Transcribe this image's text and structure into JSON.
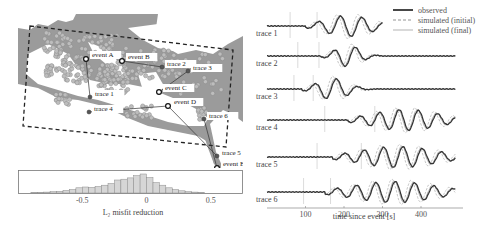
{
  "figure": {
    "map_panel": {
      "events": [
        {
          "label": "event A",
          "x": 68,
          "y": 45
        },
        {
          "label": "event B",
          "x": 104,
          "y": 47
        },
        {
          "label": "event C",
          "x": 141,
          "y": 78
        },
        {
          "label": "event D",
          "x": 150,
          "y": 92
        },
        {
          "label": "event E",
          "x": 199,
          "y": 154
        }
      ],
      "traces": [
        {
          "label": "trace 1",
          "x": 72,
          "y": 83,
          "from": "event A"
        },
        {
          "label": "trace 2",
          "x": 144,
          "y": 53,
          "from": "event B"
        },
        {
          "label": "trace 3",
          "x": 170,
          "y": 57,
          "from": "event C"
        },
        {
          "label": "trace 4",
          "x": 71,
          "y": 98,
          "from": "event D"
        },
        {
          "label": "trace 5",
          "x": 199,
          "y": 142,
          "from": "event D"
        },
        {
          "label": "trace 6",
          "x": 186,
          "y": 105,
          "from": "event E"
        }
      ],
      "colors": {
        "sea": "#9b9b9b",
        "land": "#ffffff",
        "station": "#bdbdbd",
        "station_edge": "#8a8a8a",
        "box": "#222222"
      }
    },
    "histogram": {
      "xlabel": "L₂ misfit reduction",
      "ticks": [
        "-0.5",
        "0",
        "0.5"
      ],
      "tick_values": [
        -0.5,
        0,
        0.5
      ],
      "xlim": [
        -1.0,
        0.75
      ]
    },
    "waveform_panel": {
      "legend": [
        {
          "label": "observed",
          "style": "solid-dark"
        },
        {
          "label": "simulated (initial)",
          "style": "dashed"
        },
        {
          "label": "simulated (final)",
          "style": "solid-light"
        }
      ],
      "trace_labels": [
        "trace 1",
        "trace 2",
        "trace 3",
        "trace 4",
        "trace 5",
        "trace 6"
      ],
      "xlabel": "time since event [s]",
      "xticks": [
        "100",
        "200",
        "300",
        "400"
      ]
    }
  },
  "chart_data": [
    {
      "type": "bar",
      "title": "",
      "xlabel": "L₂ misfit reduction",
      "ylabel": "",
      "xlim": [
        -1.0,
        0.75
      ],
      "bin_width": 0.05,
      "bin_centers": [
        -0.875,
        -0.825,
        -0.775,
        -0.725,
        -0.675,
        -0.625,
        -0.575,
        -0.525,
        -0.475,
        -0.425,
        -0.375,
        -0.325,
        -0.275,
        -0.225,
        -0.175,
        -0.125,
        -0.075,
        -0.025,
        0.025,
        0.075,
        0.125,
        0.175,
        0.225,
        0.275,
        0.325,
        0.375,
        0.425
      ],
      "values": [
        1,
        1,
        2,
        3,
        4,
        6,
        8,
        12,
        14,
        13,
        15,
        18,
        22,
        30,
        32,
        35,
        40,
        44,
        36,
        24,
        18,
        12,
        8,
        5,
        3,
        2,
        1
      ],
      "grid": false
    },
    {
      "type": "line",
      "title": "",
      "xlabel": "time since event [s]",
      "ylabel": "",
      "xlim": [
        0,
        500
      ],
      "xticks": [
        100,
        200,
        300,
        400
      ],
      "legend": [
        "observed",
        "simulated (initial)",
        "simulated (final)"
      ],
      "legend_position": "upper right",
      "series": [
        {
          "name": "trace 1",
          "x_end": 300,
          "arrival_markers": [
            60,
            130
          ],
          "energy_window": [
            120,
            300
          ]
        },
        {
          "name": "trace 2",
          "x_end": 490,
          "arrival_markers": [
            80,
            135
          ],
          "energy_window": [
            160,
            260
          ]
        },
        {
          "name": "trace 3",
          "x_end": 490,
          "arrival_markers": [
            70,
            120
          ],
          "energy_window": [
            110,
            230
          ]
        },
        {
          "name": "trace 4",
          "x_end": 490,
          "arrival_markers": [
            150,
            280
          ],
          "energy_window": [
            230,
            490
          ]
        },
        {
          "name": "trace 5",
          "x_end": 490,
          "arrival_markers": [
            130,
            245
          ],
          "energy_window": [
            190,
            490
          ]
        },
        {
          "name": "trace 6",
          "x_end": 490,
          "arrival_markers": [
            95,
            165
          ],
          "energy_window": [
            170,
            490
          ]
        }
      ]
    }
  ]
}
